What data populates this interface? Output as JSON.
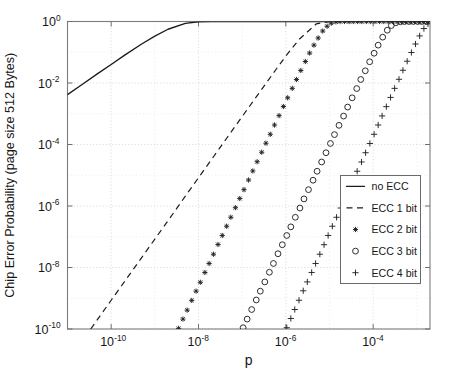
{
  "chart_data": {
    "type": "line",
    "title": "",
    "xlabel": "p",
    "ylabel": "Chip Error Probability (page size 512 Bytes)",
    "xscale": "log",
    "yscale": "log",
    "xlim": [
      1e-11,
      0.002
    ],
    "ylim": [
      1e-10,
      1
    ],
    "grid": true,
    "legend_position": "lower right",
    "xticks": [
      "10^-10",
      "10^-8",
      "10^-6",
      "10^-4"
    ],
    "xtick_values": [
      1e-10,
      1e-08,
      1e-06,
      0.0001
    ],
    "xtick_mantissa": [
      "10",
      "10",
      "10",
      "10"
    ],
    "xtick_exponents": [
      "-10",
      "-8",
      "-6",
      "-4"
    ],
    "yticks": [
      "10^0",
      "10^-2",
      "10^-4",
      "10^-6",
      "10^-8",
      "10^-10"
    ],
    "ytick_values": [
      1,
      0.01,
      0.0001,
      1e-06,
      1e-08,
      1e-10
    ],
    "ytick_mantissa": [
      "10",
      "10",
      "10",
      "10",
      "10",
      "10"
    ],
    "ytick_exponents": [
      "0",
      "-2",
      "-4",
      "-6",
      "-8",
      "-10"
    ],
    "series": [
      {
        "name": "no ECC",
        "style": "solid",
        "marker": "none",
        "color": "#1c1c1c",
        "x": [
          1e-11,
          2e-11,
          5e-11,
          1e-10,
          2e-10,
          5e-10,
          1e-09,
          2e-09,
          5e-09,
          1e-08,
          2e-08,
          5e-08,
          1e-07,
          2e-07,
          5e-07,
          1e-06,
          2e-06,
          5e-06,
          1e-05,
          2e-05,
          5e-05,
          0.0001,
          0.0002,
          0.0005,
          0.001,
          0.002
        ],
        "y": [
          0.0042,
          0.0083,
          0.0205,
          0.04,
          0.079,
          0.185,
          0.335,
          0.56,
          0.87,
          0.983,
          0.9997,
          1.0,
          1.0,
          1.0,
          1.0,
          1.0,
          1.0,
          1.0,
          1.0,
          1.0,
          1.0,
          1.0,
          1.0,
          1.0,
          1.0,
          1.0
        ]
      },
      {
        "name": "ECC 1 bit",
        "style": "dashed",
        "marker": "none",
        "color": "#1c1c1c",
        "x": [
          3.4e-11,
          6e-11,
          1e-10,
          2e-10,
          5e-10,
          1e-09,
          2e-09,
          5e-09,
          1e-08,
          2e-08,
          5e-08,
          1e-07,
          2e-07,
          4e-07,
          6e-07,
          8e-07,
          1e-06,
          2e-06,
          5e-06,
          1e-05,
          0.0001,
          0.001,
          0.002
        ],
        "y": [
          1e-10,
          3.1e-10,
          8.6e-10,
          3.4e-09,
          2.1e-08,
          8.4e-08,
          3.3e-07,
          2.1e-06,
          8.3e-06,
          3.3e-05,
          0.000205,
          0.00081,
          0.0032,
          0.0126,
          0.028,
          0.049,
          0.075,
          0.26,
          0.84,
          0.99,
          1.0,
          1.0,
          1.0
        ]
      },
      {
        "name": "ECC 2 bit",
        "style": "none",
        "marker": "star",
        "color": "#232323",
        "x": [
          3.5e-09,
          4.4e-09,
          5.5e-09,
          7e-09,
          8.8e-09,
          1.1e-08,
          1.4e-08,
          1.75e-08,
          2.2e-08,
          2.8e-08,
          3.5e-08,
          4.4e-08,
          5.5e-08,
          7e-08,
          8.8e-08,
          1.1e-07,
          1.4e-07,
          1.75e-07,
          2.2e-07,
          2.8e-07,
          3.5e-07,
          4.4e-07,
          5.5e-07,
          7e-07,
          8.8e-07,
          1.1e-06,
          1.4e-06,
          1.75e-06,
          2.2e-06,
          2.8e-06,
          3.5e-06,
          4.4e-06,
          5.5e-06,
          7e-06,
          8.8e-06,
          1.1e-05,
          1.4e-05,
          1.75e-05,
          2.2e-05,
          2.8e-05,
          3.5e-05,
          4.4e-05,
          5.5e-05,
          7e-05,
          8.8e-05,
          0.00011,
          0.00014,
          0.000175,
          0.00022,
          0.00028,
          0.00035,
          0.00044,
          0.00055,
          0.0007,
          0.00088,
          0.0011,
          0.0014,
          0.00175
        ],
        "y": [
          1.05e-10,
          2.1e-10,
          4.1e-10,
          8.5e-10,
          1.7e-09,
          3.3e-09,
          6.9e-09,
          1.35e-08,
          2.7e-08,
          5.6e-08,
          1.1e-07,
          2.2e-07,
          4.3e-07,
          8.8e-07,
          1.75e-06,
          3.4e-06,
          7e-06,
          1.38e-05,
          2.75e-05,
          5.6e-05,
          0.00011,
          0.000215,
          0.00043,
          0.00087,
          0.00172,
          0.0033,
          0.0067,
          0.013,
          0.0255,
          0.05,
          0.094,
          0.17,
          0.29,
          0.49,
          0.7,
          0.88,
          0.97,
          0.996,
          1.0,
          1.0,
          1.0,
          1.0,
          1.0,
          1.0,
          1.0,
          1.0,
          1.0,
          1.0,
          1.0,
          1.0,
          1.0,
          1.0,
          1.0,
          1.0,
          1.0,
          1.0,
          1.0,
          1.0
        ]
      },
      {
        "name": "ECC 3 bit",
        "style": "none",
        "marker": "circle",
        "color": "#232323",
        "x": [
          1.05e-07,
          1.3e-07,
          1.65e-07,
          2.1e-07,
          2.6e-07,
          3.3e-07,
          4.2e-07,
          5.2e-07,
          6.6e-07,
          8.3e-07,
          1.05e-06,
          1.3e-06,
          1.65e-06,
          2.1e-06,
          2.6e-06,
          3.3e-06,
          4.2e-06,
          5.2e-06,
          6.6e-06,
          8.3e-06,
          1.05e-05,
          1.3e-05,
          1.65e-05,
          2.1e-05,
          2.6e-05,
          3.3e-05,
          4.2e-05,
          5.2e-05,
          6.6e-05,
          8.3e-05,
          0.000105,
          0.00013,
          0.000165,
          0.00021,
          0.00026,
          0.00033,
          0.00042,
          0.00052,
          0.00066,
          0.00083,
          0.00105,
          0.0013,
          0.00165
        ],
        "y": [
          1.1e-10,
          2.1e-10,
          4.3e-10,
          8.8e-10,
          1.7e-09,
          3.4e-09,
          7e-09,
          1.35e-08,
          2.8e-08,
          5.5e-08,
          1.1e-07,
          2.1e-07,
          4.3e-07,
          8.6e-07,
          1.7e-06,
          3.4e-06,
          6.9e-06,
          1.35e-05,
          2.7e-05,
          5.4e-05,
          0.000108,
          0.00021,
          0.00042,
          0.00084,
          0.00165,
          0.0033,
          0.0066,
          0.013,
          0.025,
          0.049,
          0.093,
          0.17,
          0.31,
          0.52,
          0.74,
          0.91,
          0.98,
          0.998,
          1.0,
          1.0,
          1.0,
          1.0,
          1.0
        ]
      },
      {
        "name": "ECC 4 bit",
        "style": "none",
        "marker": "plus",
        "color": "#232323",
        "x": [
          1.05e-06,
          1.3e-06,
          1.6e-06,
          2e-06,
          2.5e-06,
          3.1e-06,
          3.9e-06,
          4.8e-06,
          6e-06,
          7.5e-06,
          9.3e-06,
          1.16e-05,
          1.45e-05,
          1.8e-05,
          2.25e-05,
          2.8e-05,
          3.5e-05,
          4.3e-05,
          5.4e-05,
          6.7e-05,
          8.4e-05,
          0.000105,
          0.00013,
          0.00016,
          0.0002,
          0.00025,
          0.00031,
          0.00039,
          0.00048,
          0.0006,
          0.00075,
          0.00093,
          0.00116,
          0.00145,
          0.0018
        ],
        "y": [
          1.1e-10,
          2.2e-10,
          4.3e-10,
          8.6e-10,
          1.75e-09,
          3.4e-09,
          6.9e-09,
          1.35e-08,
          2.7e-08,
          5.5e-08,
          1.1e-07,
          2.2e-07,
          4.3e-07,
          8.6e-07,
          1.72e-06,
          3.4e-06,
          6.9e-06,
          1.35e-05,
          2.7e-05,
          5.4e-05,
          0.000108,
          0.000215,
          0.00043,
          0.00085,
          0.0017,
          0.0034,
          0.0067,
          0.0132,
          0.026,
          0.051,
          0.098,
          0.185,
          0.34,
          0.59,
          0.84
        ]
      }
    ],
    "legend_entries": [
      {
        "label": "no ECC",
        "sample": "solid-line"
      },
      {
        "label": "ECC 1 bit",
        "sample": "dashed-line"
      },
      {
        "label": "ECC 2 bit",
        "sample": "star-marker"
      },
      {
        "label": "ECC 3 bit",
        "sample": "circle-marker"
      },
      {
        "label": "ECC 4 bit",
        "sample": "plus-marker"
      }
    ]
  }
}
